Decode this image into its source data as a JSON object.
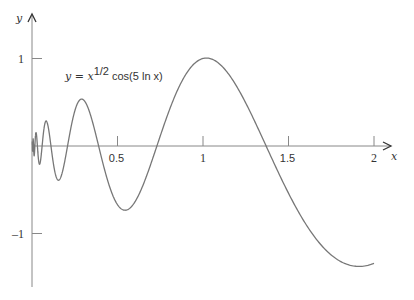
{
  "chart_data": {
    "type": "line",
    "title": "",
    "annotation": {
      "lhs": "y = x",
      "exp": "1/2",
      "rhs": " cos(5 ln x)"
    },
    "function": "y = x^(1/2) cos(5 ln x)",
    "xlabel": "x",
    "ylabel": "y",
    "x_ticks": [
      {
        "value": 0.5,
        "label": "0.5"
      },
      {
        "value": 1,
        "label": "1"
      },
      {
        "value": 1.5,
        "label": "1.5"
      },
      {
        "value": 2,
        "label": "2"
      }
    ],
    "y_ticks": [
      {
        "value": 1,
        "label": "1"
      },
      {
        "value": -1,
        "label": "-1"
      }
    ],
    "xlim": [
      0,
      2
    ],
    "ylim": [
      -1.6,
      1.5
    ],
    "grid": false,
    "legend": "none",
    "line_color": "#777777",
    "axis_color": "#888888",
    "key_points": [
      {
        "x": 0.29,
        "y": 0.56
      },
      {
        "x": 0.54,
        "y": -0.71
      },
      {
        "x": 1.02,
        "y": 1.0
      },
      {
        "x": 1.9,
        "y": -1.37
      },
      {
        "x": 2.0,
        "y": -1.34
      }
    ]
  }
}
